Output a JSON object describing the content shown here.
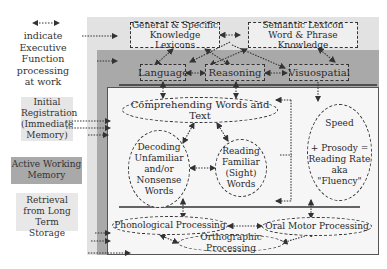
{
  "legend": {
    "arrow_caption": [
      "indicate",
      "Executive",
      "Function",
      "processing",
      "at work"
    ],
    "initial_registration": [
      "Initial",
      "Registration",
      "(Immediate",
      "Memory)"
    ],
    "active_working_memory": [
      "Active Working",
      "Memory"
    ],
    "retrieval": [
      "Retrieval",
      "from Long",
      "Term Storage"
    ]
  },
  "knowledge": {
    "general": [
      "General & Specific",
      "Knowledge Lexicons"
    ],
    "semantic": [
      "Semantic Lexicon",
      "Word & Phrase Knowledge"
    ]
  },
  "domains": {
    "language": "Language",
    "reasoning": "Reasoning",
    "visuospatial": "Visuospatial"
  },
  "reading": {
    "comprehending": "Comprehending Words and Text",
    "decoding": [
      "Decoding",
      "Unfamiliar",
      "and/or",
      "Nonsense",
      "Words"
    ],
    "familiar": [
      "Reading",
      "Familiar",
      "(Sight)",
      "Words"
    ],
    "fluency": {
      "speed": "Speed",
      "lines": [
        "+ Prosody =",
        "Reading Rate",
        "aka",
        "\"Fluency\""
      ]
    }
  },
  "processing": {
    "phonological": "Phonological Processing",
    "oral_motor": "Oral Motor Processing",
    "orthographic": "Orthographic Processing"
  },
  "colors": {
    "initial_registration": "#e2e2e2",
    "active_working_memory": "#a9a9a9",
    "retrieval": "#f6f6f6"
  }
}
